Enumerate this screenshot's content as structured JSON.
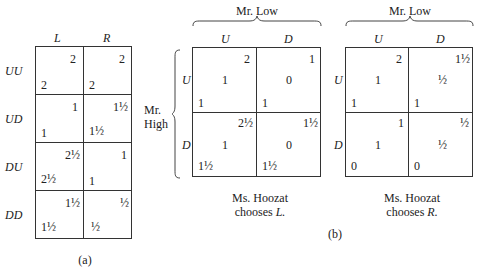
{
  "panel_a": {
    "label": "(a)",
    "columns": [
      "L",
      "R"
    ],
    "rows": [
      {
        "label": "UU",
        "cells": [
          {
            "top": "2",
            "bottom": "2"
          },
          {
            "top": "2",
            "bottom": "2"
          }
        ]
      },
      {
        "label": "UD",
        "cells": [
          {
            "top": "1",
            "bottom": "1"
          },
          {
            "top": "1½",
            "bottom": "1½"
          }
        ]
      },
      {
        "label": "DU",
        "cells": [
          {
            "top": "2½",
            "bottom": "2½"
          },
          {
            "top": "1",
            "bottom": "1"
          }
        ]
      },
      {
        "label": "DD",
        "cells": [
          {
            "top": "1½",
            "bottom": "1½"
          },
          {
            "top": "½",
            "bottom": "½"
          }
        ]
      }
    ]
  },
  "panel_b": {
    "label": "(b)",
    "row_player": "Mr. High",
    "row_player_line1": "Mr.",
    "row_player_line2": "High",
    "tables": [
      {
        "column_player": "Mr. Low",
        "columns": [
          "U",
          "D"
        ],
        "row_labels": [
          "U",
          "D"
        ],
        "caption_line1": "Ms. Hoozat",
        "caption_line2": "chooses",
        "caption_choice": "L.",
        "cells": [
          [
            {
              "top": "2",
              "mid": "1",
              "bottom": "1"
            },
            {
              "top": "1",
              "mid": "0",
              "bottom": "1"
            }
          ],
          [
            {
              "top": "2½",
              "mid": "1",
              "bottom": "1½"
            },
            {
              "top": "1½",
              "mid": "0",
              "bottom": "1½"
            }
          ]
        ]
      },
      {
        "column_player": "Mr. Low",
        "columns": [
          "U",
          "D"
        ],
        "row_labels": [
          "U",
          "D"
        ],
        "caption_line1": "Ms. Hoozat",
        "caption_line2": "chooses",
        "caption_choice": "R.",
        "cells": [
          [
            {
              "top": "2",
              "mid": "1",
              "bottom": "1"
            },
            {
              "top": "1½",
              "mid": "½",
              "bottom": "1"
            }
          ],
          [
            {
              "top": "1",
              "mid": "1",
              "bottom": "0"
            },
            {
              "top": "½",
              "mid": "½",
              "bottom": "0"
            }
          ]
        ]
      }
    ]
  }
}
